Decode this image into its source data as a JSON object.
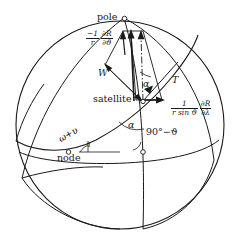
{
  "figure": {
    "type": "spherical-geometry-diagram",
    "background": "#ffffff",
    "stroke_color": "#1a1a1a",
    "width": 246,
    "height": 251
  },
  "labels": {
    "pole": "pole",
    "satellite": "satellite",
    "node": "node",
    "W": "W",
    "T": "T",
    "alpha_upper": "α",
    "alpha_lower": "α",
    "inclination": "i",
    "colatitude": "90°−ϑ",
    "arg_latitude_omega": "ω",
    "arg_latitude_plus": "+",
    "arg_latitude_nu": "υ"
  },
  "formula_theta": {
    "sign": "−1",
    "num_denom": "r",
    "partial_num": "∂R",
    "partial_den": "∂ϑ"
  },
  "formula_lambda": {
    "num": "1",
    "den": "r sin ϑ",
    "partial_num": "∂R",
    "partial_den": "∂λ"
  },
  "markers": {
    "pole_point": "pole-marker",
    "satellite_point": "satellite-marker",
    "node_point": "node-marker",
    "equator_point": "equator-crossing-marker"
  }
}
